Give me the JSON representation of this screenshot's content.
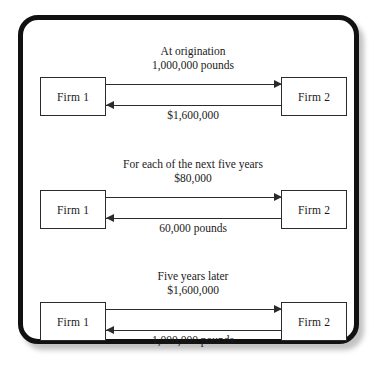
{
  "diagram": {
    "frame": {
      "border_color": "#111111",
      "background_color": "#ffffff",
      "shadow_color": "#787878"
    },
    "groups": [
      {
        "id": "at-origination",
        "heading": "At origination",
        "forward": {
          "from": "Firm 1",
          "to": "Firm 2",
          "amount": "1,000,000 pounds",
          "direction": "left-to-right"
        },
        "backward": {
          "from": "Firm 2",
          "to": "Firm 1",
          "amount": "$1,600,000",
          "direction": "right-to-left"
        },
        "left_box_label": "Firm 1",
        "right_box_label": "Firm 2"
      },
      {
        "id": "each-of-next-five-years",
        "heading": "For each of the next five years",
        "forward": {
          "from": "Firm 1",
          "to": "Firm 2",
          "amount": "$80,000",
          "direction": "left-to-right"
        },
        "backward": {
          "from": "Firm 2",
          "to": "Firm 1",
          "amount": "60,000 pounds",
          "direction": "right-to-left"
        },
        "left_box_label": "Firm 1",
        "right_box_label": "Firm 2"
      },
      {
        "id": "five-years-later",
        "heading": "Five years later",
        "forward": {
          "from": "Firm 1",
          "to": "Firm 2",
          "amount": "$1,600,000",
          "direction": "left-to-right"
        },
        "backward": {
          "from": "Firm 2",
          "to": "Firm 1",
          "amount": "1,000,000 pounds",
          "direction": "right-to-left"
        },
        "left_box_label": "Firm 1",
        "right_box_label": "Firm 2"
      }
    ]
  }
}
